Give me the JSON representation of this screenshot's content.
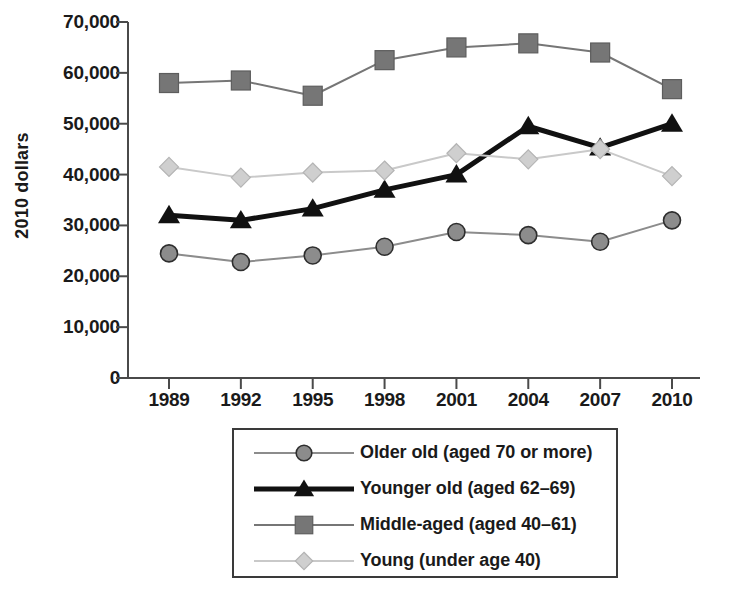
{
  "chart_data": {
    "type": "line",
    "title": "",
    "xlabel": "",
    "ylabel": "2010 dollars",
    "categories": [
      "1989",
      "1992",
      "1995",
      "1998",
      "2001",
      "2004",
      "2007",
      "2010"
    ],
    "ylim": [
      0,
      70000
    ],
    "ytick_labels": [
      "70,000",
      "60,000",
      "50,000",
      "40,000",
      "30,000",
      "20,000",
      "10,000",
      "0"
    ],
    "ytick_values": [
      70000,
      60000,
      50000,
      40000,
      30000,
      20000,
      10000,
      0
    ],
    "grid": false,
    "legend_position": "below-center",
    "series": [
      {
        "name": "Older old (aged 70 or more)",
        "marker": "circle",
        "color": "#8c8c8c",
        "line_color": "#8c8c8c",
        "line_width": 2,
        "values": [
          24500,
          22800,
          24100,
          25800,
          28700,
          28100,
          26800,
          31000
        ]
      },
      {
        "name": "Younger old (aged 62–69)",
        "marker": "triangle",
        "color": "#111111",
        "line_color": "#111111",
        "line_width": 5,
        "values": [
          32000,
          31000,
          33300,
          37000,
          40000,
          49500,
          45300,
          50000
        ]
      },
      {
        "name": "Middle-aged (aged 40–61)",
        "marker": "square",
        "color": "#767676",
        "line_color": "#767676",
        "line_width": 2,
        "values": [
          58000,
          58500,
          55500,
          62500,
          65000,
          65800,
          64000,
          56800
        ]
      },
      {
        "name": "Young (under age 40)",
        "marker": "diamond",
        "color": "#cfcfcf",
        "line_color": "#c9c9c9",
        "line_width": 2,
        "values": [
          41500,
          39400,
          40400,
          40800,
          44200,
          43000,
          45000,
          39700
        ]
      }
    ]
  },
  "axes": {
    "y_axis_label": "2010 dollars"
  },
  "legend": {
    "entries": [
      "Older old (aged 70 or more)",
      "Younger old (aged 62–69)",
      "Middle-aged (aged 40–61)",
      "Young (under age 40)"
    ]
  }
}
